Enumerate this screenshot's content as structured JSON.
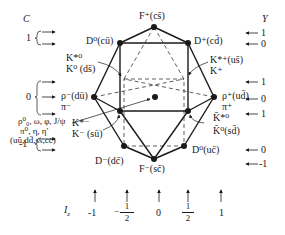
{
  "diagram": {
    "axes": {
      "left": {
        "label": "C",
        "values": [
          "1",
          "0",
          "-1"
        ]
      },
      "right": {
        "label": "Y",
        "values": [
          "1",
          "0",
          "1",
          "0",
          "1",
          "0",
          "-1"
        ]
      },
      "bottom": {
        "label": "I_z",
        "values": [
          "-1",
          "-1/2",
          "0",
          "1/2",
          "1"
        ]
      }
    },
    "nodes": {
      "F_plus": "F⁺(cs̄)",
      "D0_top": "D⁰(cū)",
      "D_plus": "D⁺(cd̄)",
      "K0_star_label1": "K*⁰",
      "K0_label2": "K⁰ (ds̄)",
      "K_plus_star_label1": "K*⁺(us̄)",
      "K_plus_label2": "K⁺",
      "rho_minus": "ρ⁻(dū)",
      "pi_minus": "π⁻",
      "rho_plus": "ρ⁺(ud̄)",
      "pi_plus": "π⁺",
      "neutral_line1": "ρ⁰₀, ω, φ, J/ψ",
      "neutral_line2": "π⁰, η, η′",
      "neutral_line3": "(uū,dd̄,ss̄,cc̄)",
      "K_minus_star": "K*⁻",
      "K_minus": "K⁻ (sū)",
      "K0bar_star": "K̄*⁰",
      "K0bar": "K̄⁰(sd̄)",
      "D_minus": "D⁻(dc̄)",
      "D0_bottom": "D⁰(uc̄)",
      "F_minus": "F⁻(sc̄)"
    }
  }
}
